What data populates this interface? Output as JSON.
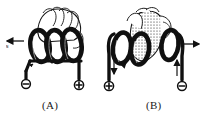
{
  "figure": {
    "background_color": "#ffffff",
    "ink_color": "#101010",
    "panels": [
      {
        "id": "A",
        "caption": "(A)",
        "coil": {
          "turns": 3,
          "winding_sense": "clockwise-front-to-back",
          "loop_count_visible": 3
        },
        "hand": {
          "description": "hand gripping coil, fingers curling over top",
          "shading": "outline"
        },
        "field_arrow": {
          "direction": "left",
          "label": "N",
          "position": "left"
        },
        "terminals": [
          {
            "polarity": "-",
            "symbol": "⊖",
            "side": "left"
          },
          {
            "polarity": "+",
            "symbol": "⊕",
            "side": "right"
          }
        ]
      },
      {
        "id": "B",
        "caption": "(B)",
        "coil": {
          "turns": 3,
          "winding_sense": "counter-clockwise-front-to-back",
          "loop_count_visible": 3
        },
        "hand": {
          "description": "hand gripping coil with stippled palm",
          "shading": "stippled"
        },
        "field_arrow": {
          "direction": "right",
          "label": "N",
          "position": "right"
        },
        "terminals": [
          {
            "polarity": "+",
            "symbol": "⊕",
            "side": "left"
          },
          {
            "polarity": "-",
            "symbol": "⊖",
            "side": "right"
          }
        ],
        "current_arrows": [
          {
            "direction": "down",
            "side": "left"
          },
          {
            "direction": "up",
            "side": "right"
          }
        ]
      }
    ]
  }
}
